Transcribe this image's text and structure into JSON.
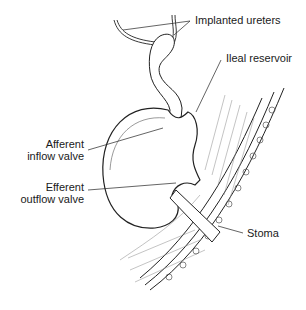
{
  "diagram": {
    "labels": {
      "implanted_ureters": "Implanted ureters",
      "ileal_reservoir": "Ileal reservoir",
      "afferent_line1": "Afferent",
      "afferent_line2": "inflow valve",
      "efferent_line1": "Efferent",
      "efferent_line2": "outflow valve",
      "stoma": "Stoma"
    },
    "colors": {
      "line": "#222222",
      "background": "#ffffff",
      "hatch": "#888888"
    }
  }
}
